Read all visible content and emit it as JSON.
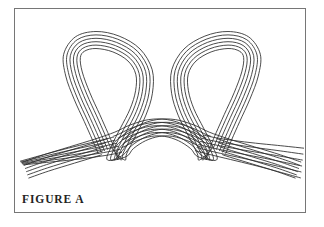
{
  "figure": {
    "caption": "FIGURE A",
    "title": "FIGURE A",
    "domain": "technical-line-drawing",
    "strand_count": 6,
    "colors": {
      "background": "#ffffff",
      "line": "#2b2b2b",
      "border": "#767676",
      "caption": "#232323"
    },
    "border": {
      "x": 14,
      "y": 8,
      "width": 292,
      "height": 205,
      "stroke_width": 1
    },
    "line_style": {
      "stroke_width": 0.85,
      "fill": "none",
      "linecap": "round"
    },
    "geometry": {
      "loop_top_y": 38,
      "loop_left_x": 68,
      "loop_right_x": 244,
      "loop_bottom_y": 160,
      "crossing_left_x": 120,
      "crossing_right_x": 196,
      "tail_left_end_x": 24,
      "tail_right_end_x": 302,
      "strand_spacing": 3.4
    }
  }
}
